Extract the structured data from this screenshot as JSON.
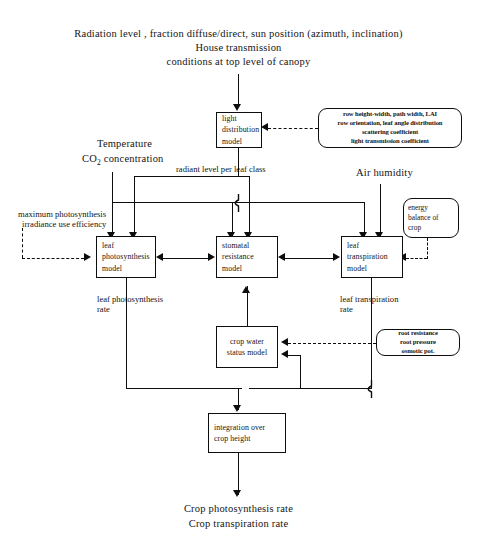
{
  "diagram": {
    "header": {
      "line1": "Radiation level , fraction diffuse/direct, sun position (azimuth, inclination)",
      "line2": "House transmission",
      "line3": "conditions at top level of canopy"
    },
    "boxes": {
      "light_distribution": {
        "l1": "light",
        "l2": "distribution",
        "l3": "model"
      },
      "leaf_photosynthesis": {
        "l1": "leaf",
        "l2": "photosynthesis",
        "l3": "model"
      },
      "stomatal_resistance": {
        "l1": "stomatal",
        "l2": "resistance",
        "l3": "model"
      },
      "leaf_transpiration": {
        "l1": "leaf",
        "l2": "transpiration",
        "l3": "model"
      },
      "crop_water_status": {
        "l1": "crop water",
        "l2": "status model"
      },
      "integration": {
        "l1": "integration over",
        "l2": "crop height"
      }
    },
    "bubbles": {
      "light_params": {
        "l1": "row height-width, path width, LAI",
        "l2": "row orientation, leaf angle distribution",
        "l3": "scattering coefficient",
        "l4": "light transmission coefficient"
      },
      "energy_balance": {
        "l1": "energy",
        "l2": "balance of",
        "l3": "crop"
      },
      "root_params": {
        "l1": "root resistance",
        "l2": "root pressure",
        "l3": "osmotic pot."
      }
    },
    "labels": {
      "temperature": "Temperature",
      "co2_prefix": "CO",
      "co2_sub": "2",
      "co2_suffix": " concentration",
      "air_humidity": "Air humidity",
      "radiant_level": "radiant level per leaf class",
      "max_photosynthesis_l1": "maximum photosynthesis",
      "max_photosynthesis_l2": "irradiance use efficiency",
      "leaf_photo_rate_l1": "leaf photosynthesis",
      "leaf_photo_rate_l2": "rate",
      "leaf_transp_rate_l1": "leaf transpiration",
      "leaf_transp_rate_l2": "rate"
    },
    "outputs": {
      "line1": "Crop photosynthesis rate",
      "line2": "Crop transpiration rate"
    },
    "colors": {
      "ink": "#0d0d0d",
      "paper": "#ffffff"
    }
  }
}
